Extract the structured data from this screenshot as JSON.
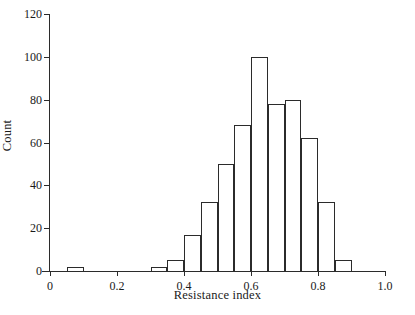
{
  "chart_data": {
    "type": "bar",
    "title": "",
    "subtitle": "",
    "xlabel": "Resistance index",
    "ylabel": "Count",
    "xlim": [
      0,
      1.0
    ],
    "ylim": [
      0,
      120
    ],
    "bin_width": 0.05,
    "grid": false,
    "legend": null,
    "xticks": [
      0,
      0.2,
      0.4,
      0.6,
      0.8,
      1.0
    ],
    "xtick_labels": [
      "0",
      "0.2",
      "0.4",
      "0.6",
      "0.8",
      "1.0"
    ],
    "yticks": [
      0,
      20,
      40,
      60,
      80,
      100,
      120
    ],
    "ytick_labels": [
      "0",
      "20",
      "40",
      "60",
      "80",
      "100",
      "120"
    ],
    "bin_starts": [
      0.05,
      0.3,
      0.35,
      0.4,
      0.45,
      0.5,
      0.55,
      0.6,
      0.65,
      0.7,
      0.75,
      0.8,
      0.85
    ],
    "categories": [
      "0.05",
      "0.30",
      "0.35",
      "0.40",
      "0.45",
      "0.50",
      "0.55",
      "0.60",
      "0.65",
      "0.70",
      "0.75",
      "0.80",
      "0.85"
    ],
    "values": [
      2,
      2,
      5,
      17,
      32,
      50,
      68,
      100,
      78,
      80,
      62,
      32,
      5
    ],
    "bar_color": "#ffffff",
    "bar_edge_color": "#2b2b2b",
    "axis_color": "#2b2b2b",
    "background_color": "#ffffff"
  }
}
